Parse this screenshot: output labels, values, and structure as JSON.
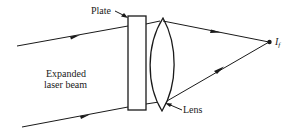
{
  "diagram": {
    "labels": {
      "plate": "Plate",
      "beam_line1": "Expanded",
      "beam_line2": "laser beam",
      "lens": "Lens",
      "focus_main": "I",
      "focus_sub": "f"
    },
    "colors": {
      "stroke": "#1a1a1a",
      "background": "#ffffff"
    },
    "elements": [
      "incoming-ray-top",
      "incoming-ray-bottom",
      "plate",
      "lens",
      "outgoing-ray-top",
      "outgoing-ray-bottom",
      "focal-point"
    ]
  }
}
